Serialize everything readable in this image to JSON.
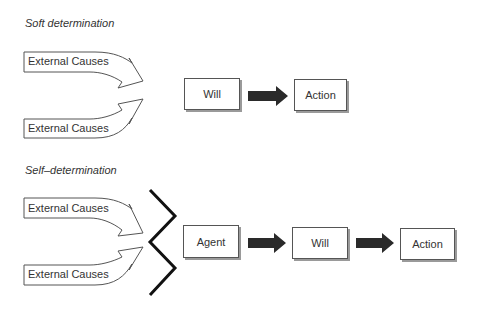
{
  "soft": {
    "title": "Soft determination",
    "causes": [
      "External Causes",
      "External Causes"
    ],
    "nodes": [
      "Will",
      "Action"
    ]
  },
  "self": {
    "title": "Self–determination",
    "causes": [
      "External Causes",
      "External Causes"
    ],
    "nodes": [
      "Agent",
      "Will",
      "Action"
    ]
  },
  "colors": {
    "stroke": "#555555",
    "arrow_fill": "#2a2a2a",
    "zigzag": "#111111",
    "shadow": "#9a9a9a"
  }
}
